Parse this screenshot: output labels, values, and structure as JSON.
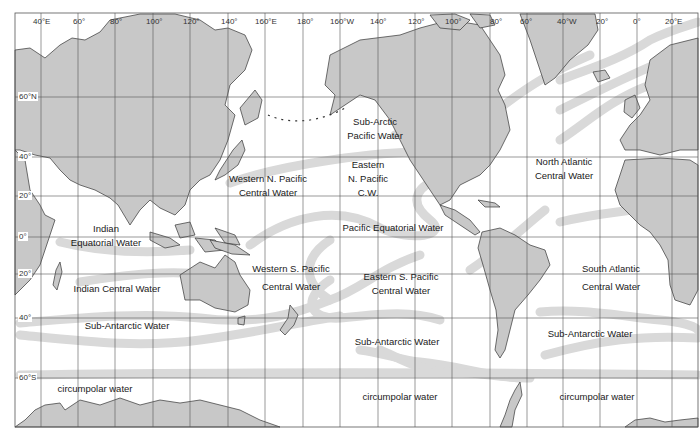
{
  "colors": {
    "land": "#c8c8c8",
    "land_stroke": "#333333",
    "grid": "#555555",
    "water_mass_boundary": "#d9d9d9",
    "ocean": "#ffffff"
  },
  "axes": {
    "longitude_ticks": [
      "40°E",
      "60°",
      "80°",
      "100°",
      "120°",
      "140°",
      "160°E",
      "180°",
      "160°W",
      "140°",
      "120°",
      "100°",
      "80°",
      "60°",
      "40°W",
      "20°",
      "0°",
      "20°E"
    ],
    "latitude_ticks": [
      "60°N",
      "40°",
      "20°",
      "0°",
      "20°",
      "40°",
      "60°S"
    ]
  },
  "water_masses": [
    {
      "id": "sub-arctic-pacific",
      "lines": [
        "Sub-Arctic",
        "Pacific Water"
      ]
    },
    {
      "id": "western-n-pacific",
      "lines": [
        "Western N. Pacific",
        "Central Water"
      ]
    },
    {
      "id": "eastern-n-pacific",
      "lines": [
        "Eastern",
        "N. Pacific",
        "C.W."
      ]
    },
    {
      "id": "north-atlantic",
      "lines": [
        "North Atlantic",
        "Central Water"
      ]
    },
    {
      "id": "indian-equatorial",
      "lines": [
        "Indian",
        "Equatorial Water"
      ]
    },
    {
      "id": "pacific-equatorial",
      "lines": [
        "Pacific Equatorial Water"
      ]
    },
    {
      "id": "western-s-pacific",
      "lines": [
        "Western S. Pacific",
        "Central Water"
      ]
    },
    {
      "id": "eastern-s-pacific",
      "lines": [
        "Eastern S. Pacific",
        "Central Water"
      ]
    },
    {
      "id": "south-atlantic",
      "lines": [
        "South Atlantic",
        "Central Water"
      ]
    },
    {
      "id": "indian-central",
      "lines": [
        "Indian Central Water"
      ]
    },
    {
      "id": "sub-antarctic-indian",
      "lines": [
        "Sub-Antarctic Water"
      ]
    },
    {
      "id": "sub-antarctic-pacific",
      "lines": [
        "Sub-Antarctic Water"
      ]
    },
    {
      "id": "sub-antarctic-atlantic",
      "lines": [
        "Sub-Antarctic Water"
      ]
    },
    {
      "id": "circumpolar-indian",
      "lines": [
        "circumpolar water"
      ]
    },
    {
      "id": "circumpolar-pacific",
      "lines": [
        "circumpolar water"
      ]
    },
    {
      "id": "circumpolar-atlantic",
      "lines": [
        "circumpolar water"
      ]
    }
  ]
}
